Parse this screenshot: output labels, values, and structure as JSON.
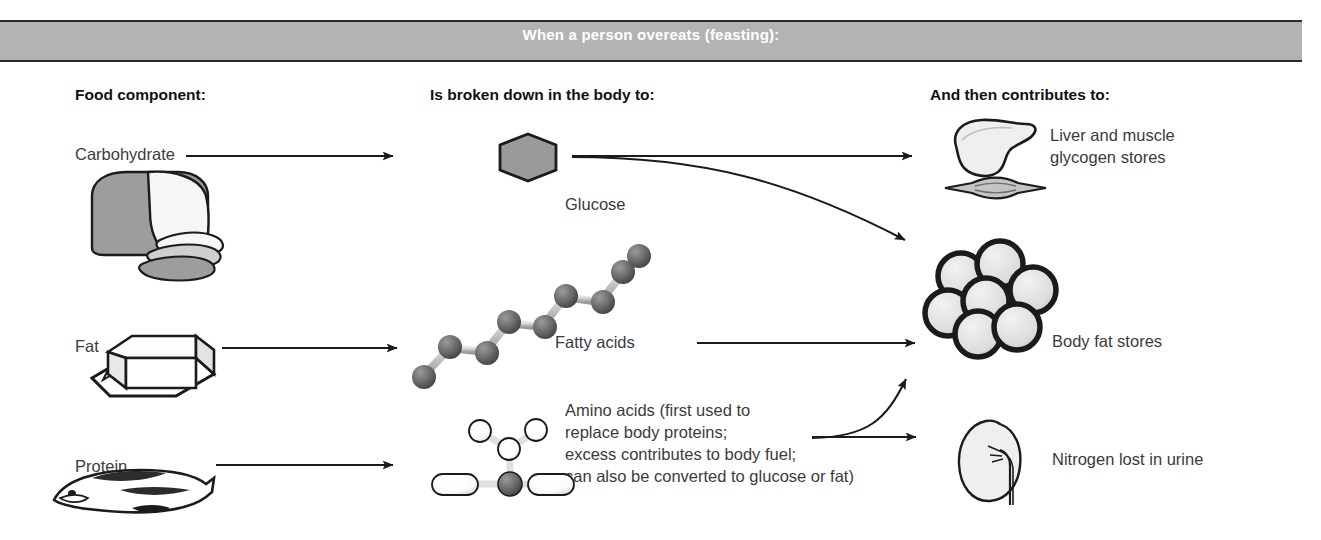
{
  "banner": {
    "title": "When a person overeats (feasting):",
    "bg": "#b3b3b3",
    "text_color": "#ffffff"
  },
  "columns": {
    "food": "Food component:",
    "breakdown": "Is broken down in the body to:",
    "contributes": "And then contributes to:"
  },
  "rows": [
    {
      "food_label": "Carbohydrate",
      "food_icon": "bread-loaf-icon",
      "metabolite_label": "Glucose",
      "metabolite_icon": "glucose-hexagon-icon",
      "destinations": [
        "Liver and muscle glycogen stores",
        "Body fat stores"
      ]
    },
    {
      "food_label": "Fat",
      "food_icon": "butter-stick-icon",
      "metabolite_label": "Fatty acids",
      "metabolite_icon": "fatty-acid-chain-icon",
      "destinations": [
        "Body fat stores"
      ]
    },
    {
      "food_label": "Protein",
      "food_icon": "fish-icon",
      "metabolite_label": "Amino acids (first used to replace body proteins; excess contributes to body fuel; can also be converted to glucose or fat)",
      "metabolite_lines": [
        "Amino acids (first used to",
        "replace body proteins;",
        "excess contributes to body fuel;",
        "can also be converted to glucose or fat)"
      ],
      "metabolite_icon": "amino-acid-molecule-icon",
      "destinations": [
        "Body fat stores",
        "Nitrogen lost in urine"
      ]
    }
  ],
  "outcomes": {
    "glycogen": {
      "label_line1": "Liver and muscle",
      "label_line2": "glycogen stores",
      "icon": "liver-and-muscle-icon"
    },
    "bodyfat": {
      "label": "Body fat stores",
      "icon": "fat-cell-cluster-icon"
    },
    "nitrogen": {
      "label": "Nitrogen lost in urine",
      "icon": "kidney-icon"
    }
  },
  "colors": {
    "banner_gray": "#b3b3b3",
    "text_gray": "#3b3b3b",
    "ink": "#111111",
    "hexagon_fill": "#9a9a9a",
    "sphere_dark": "#5a5a5a",
    "organ_fill": "#efefef"
  }
}
